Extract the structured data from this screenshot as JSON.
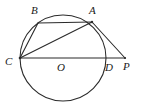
{
  "figure": {
    "stroke_color": "#2b2b2b",
    "label_color": "#1a1a1a",
    "background_color": "#ffffff",
    "width": 144,
    "height": 107
  },
  "labels": {
    "A": "A",
    "B": "B",
    "C": "C",
    "D": "D",
    "O": "O",
    "P": "P"
  },
  "label_positions": {
    "A": {
      "x": 89,
      "y": 5
    },
    "B": {
      "x": 31,
      "y": 5
    },
    "C": {
      "x": 5,
      "y": 56
    },
    "D": {
      "x": 105,
      "y": 62
    },
    "O": {
      "x": 57,
      "y": 62
    },
    "P": {
      "x": 123,
      "y": 61
    }
  },
  "geometry": {
    "circle": {
      "cx": 63,
      "cy": 58,
      "r": 43
    },
    "points": {
      "A": {
        "x": 92,
        "y": 22
      },
      "B": {
        "x": 38,
        "y": 23
      },
      "C": {
        "x": 20,
        "y": 58
      },
      "D": {
        "x": 106,
        "y": 58
      },
      "O": {
        "x": 63,
        "y": 58
      },
      "P": {
        "x": 125,
        "y": 58
      }
    },
    "segments": [
      {
        "name": "chord-BA",
        "from": "B",
        "to": "A"
      },
      {
        "name": "chord-CB",
        "from": "C",
        "to": "B"
      },
      {
        "name": "chord-CA",
        "from": "C",
        "to": "A"
      },
      {
        "name": "line-CP",
        "from": "C",
        "to": "P"
      },
      {
        "name": "line-AP",
        "from": "A",
        "to": "P"
      }
    ]
  }
}
